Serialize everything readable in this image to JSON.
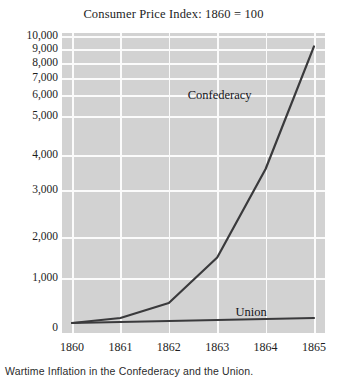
{
  "chart_data": {
    "type": "line",
    "title": "Consumer Price Index: 1860 = 100",
    "caption": "Wartime Inflation in the Confederacy and the Union.",
    "xlabel": "",
    "ylabel": "",
    "x": [
      1860,
      1861,
      1862,
      1863,
      1864,
      1865
    ],
    "xtick_labels": [
      "1860",
      "1861",
      "1862",
      "1863",
      "1864",
      "1865"
    ],
    "xlim": [
      1860,
      1865
    ],
    "yscale": "log-like-compressed",
    "ylim": [
      0,
      10000
    ],
    "ytick_values": [
      0,
      1000,
      2000,
      3000,
      4000,
      5000,
      6000,
      7000,
      8000,
      9000,
      10000
    ],
    "ytick_labels": [
      "0",
      "1,000",
      "2,000",
      "3,000",
      "4,000",
      "5,000",
      "6,000",
      "7,000",
      "8,000",
      "9,000",
      "10,000"
    ],
    "grid": true,
    "legend_position": "inline-annotation",
    "plot_background": "#d2d2d2",
    "gridline_color": "#fbfbfb",
    "series": [
      {
        "name": "Confederacy",
        "color": "#3a3a3c",
        "values": [
          100,
          200,
          500,
          1500,
          3600,
          9200
        ],
        "label_x": 1863.05,
        "label_y": 6000
      },
      {
        "name": "Union",
        "color": "#3a3a3c",
        "values": [
          100,
          120,
          140,
          160,
          180,
          200
        ],
        "label_x": 1863.7,
        "label_y": 330
      }
    ]
  }
}
